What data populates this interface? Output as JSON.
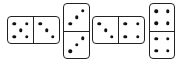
{
  "dominoes": [
    {
      "id": 1,
      "orientation": "horizontal",
      "x": 7,
      "y": 16,
      "w": 53,
      "h": 28,
      "values": [
        5,
        3
      ]
    },
    {
      "id": 2,
      "orientation": "vertical",
      "x": 63,
      "y": 3,
      "w": 27,
      "h": 56,
      "values": [
        3,
        3
      ]
    },
    {
      "id": 3,
      "orientation": "horizontal",
      "x": 92,
      "y": 16,
      "w": 53,
      "h": 28,
      "values": [
        3,
        4
      ]
    },
    {
      "id": 4,
      "orientation": "vertical",
      "x": 149,
      "y": 3,
      "w": 26,
      "h": 56,
      "values": [
        4,
        4
      ]
    }
  ],
  "colors": {
    "border": "#222222",
    "pip": "#111111",
    "face": "#ffffff"
  }
}
